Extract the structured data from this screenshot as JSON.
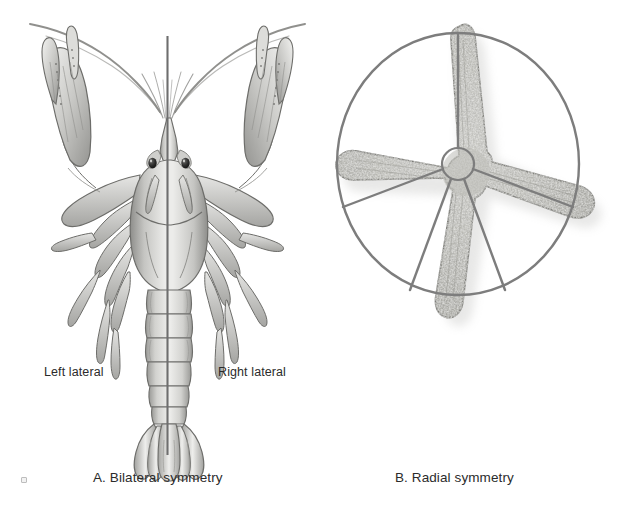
{
  "figure": {
    "width": 629,
    "height": 508,
    "background_color": "#ffffff",
    "ink_color": "#2b2b2b"
  },
  "panel_a": {
    "caption": "A. Bilateral symmetry",
    "subject": "crayfish-dorsal-view",
    "symmetry_axis": {
      "type": "vertical-line",
      "x": 167,
      "y_start": 36,
      "y_end": 455,
      "color": "#6e6e6e"
    },
    "labels": {
      "left": "Left lateral",
      "right": "Right lateral"
    }
  },
  "panel_b": {
    "caption": "B. Radial symmetry",
    "subject": "sea-star-aboral-view",
    "symmetry_guide": {
      "type": "circle-with-five-radii",
      "center_x": 458,
      "center_y": 254,
      "radius_x": 121,
      "radius_y": 131,
      "hub_radius": 16,
      "radii_count": 5,
      "color": "#7d7d7d"
    },
    "arm_count": 5
  },
  "palette": {
    "ink": "#2b2b2b",
    "guide_line": "#7d7d7d",
    "axis_line": "#6e6e6e",
    "body_light": "#e3e3e1",
    "body_mid": "#b9b9b6",
    "body_dark": "#8e8e8b",
    "outline": "#6d6d6a",
    "star_light": "#cfcfcb",
    "star_mid": "#a9a9a4",
    "star_dark": "#86868 1",
    "shadow": "#d9d9d7"
  },
  "artifact": {
    "name": "scan-speck",
    "x": 21,
    "y": 477
  }
}
